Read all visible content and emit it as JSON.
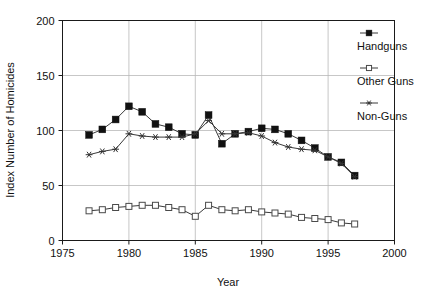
{
  "chart_data": {
    "type": "line",
    "title": "",
    "xlabel": "Year",
    "ylabel": "Index Number of Homicides",
    "xlim": [
      1975,
      2000
    ],
    "ylim": [
      0,
      200
    ],
    "xticks": [
      1975,
      1980,
      1985,
      1990,
      1995,
      2000
    ],
    "yticks": [
      0,
      50,
      100,
      150,
      200
    ],
    "grid": true,
    "legend_position": "right",
    "x": [
      1977,
      1978,
      1979,
      1980,
      1981,
      1982,
      1983,
      1984,
      1985,
      1986,
      1987,
      1988,
      1989,
      1990,
      1991,
      1992,
      1993,
      1994,
      1995,
      1996,
      1997
    ],
    "series": [
      {
        "name": "Handguns",
        "marker": "filled-square",
        "values": [
          96,
          101,
          110,
          122,
          117,
          106,
          103,
          97,
          96,
          114,
          88,
          97,
          99,
          102,
          101,
          97,
          91,
          84,
          76,
          71,
          59
        ]
      },
      {
        "name": "Other Guns",
        "marker": "open-square",
        "values": [
          27,
          28,
          30,
          31,
          32,
          32,
          30,
          28,
          22,
          32,
          28,
          27,
          28,
          26,
          25,
          24,
          21,
          20,
          19,
          16,
          15
        ]
      },
      {
        "name": "Non-Guns",
        "marker": "star",
        "values": [
          78,
          81,
          83,
          97,
          95,
          94,
          94,
          94,
          97,
          109,
          97,
          97,
          98,
          95,
          89,
          85,
          83,
          82,
          76,
          70,
          58
        ]
      }
    ]
  },
  "legend": {
    "items": [
      {
        "label": "Handguns",
        "marker": "filled-square"
      },
      {
        "label": "Other Guns",
        "marker": "open-square"
      },
      {
        "label": "Non-Guns",
        "marker": "star"
      }
    ]
  },
  "axes": {
    "xlabel": "Year",
    "ylabel": "Index Number of Homicides",
    "xticks": [
      "1975",
      "1980",
      "1985",
      "1990",
      "1995",
      "2000"
    ],
    "yticks": [
      "0",
      "50",
      "100",
      "150",
      "200"
    ]
  }
}
